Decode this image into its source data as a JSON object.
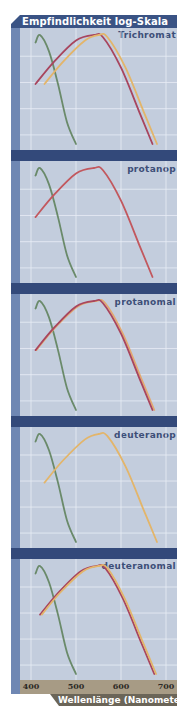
{
  "chart_data": {
    "type": "line",
    "title": "Empfindlichkeit log-Skala",
    "xlabel": "Wellenlänge (Nanometer)",
    "ylabel": "Empfindlichkeit log-Skala",
    "x_ticks": [
      "400",
      "500",
      "600",
      "700"
    ],
    "xlim": [
      390,
      710
    ],
    "grid": true,
    "legend": "none",
    "colors": {
      "S-cone": "#6a8a6a",
      "M-cone": "#e0b46a",
      "L-cone": "#b04a5a",
      "plot_bg": "#c3cddd",
      "grid": "#e6ecf4",
      "band": "#33497a"
    },
    "panels": [
      {
        "label": "Trichromat",
        "series": [
          {
            "name": "S-cone (kurzwellig)",
            "color": "#6a8a6a",
            "x": [
              410,
              420,
              440,
              460,
              480,
              500
            ],
            "y_rel": [
              0.93,
              1.0,
              0.85,
              0.55,
              0.2,
              0.0
            ]
          },
          {
            "name": "L-cone (langwellig)",
            "color": "#a8455e",
            "x": [
              410,
              450,
              500,
              540,
              560,
              600,
              640,
              670
            ],
            "y_rel": [
              0.55,
              0.75,
              0.95,
              1.0,
              0.98,
              0.7,
              0.3,
              0.0
            ]
          },
          {
            "name": "M-cone (mittelwellig)",
            "color": "#e3b56a",
            "x": [
              430,
              470,
              520,
              550,
              570,
              610,
              650,
              680
            ],
            "y_rel": [
              0.55,
              0.75,
              0.95,
              1.0,
              0.98,
              0.7,
              0.3,
              0.0
            ]
          }
        ]
      },
      {
        "label": "protanop",
        "series": [
          {
            "name": "S-cone (kurzwellig)",
            "color": "#6a8a6a",
            "x": [
              410,
              420,
              440,
              460,
              480,
              500
            ],
            "y_rel": [
              0.93,
              1.0,
              0.85,
              0.55,
              0.2,
              0.0
            ]
          },
          {
            "name": "L-cone (langwellig)",
            "color": "#c2585e",
            "x": [
              410,
              450,
              500,
              540,
              560,
              600,
              640,
              670
            ],
            "y_rel": [
              0.55,
              0.75,
              0.95,
              1.0,
              0.98,
              0.7,
              0.3,
              0.0
            ]
          }
        ]
      },
      {
        "label": "protanomal",
        "series": [
          {
            "name": "S-cone (kurzwellig)",
            "color": "#6a8a6a",
            "x": [
              410,
              420,
              440,
              460,
              480,
              500
            ],
            "y_rel": [
              0.93,
              1.0,
              0.85,
              0.55,
              0.2,
              0.0
            ]
          },
          {
            "name": "M-cone (mittelwellig)",
            "color": "#e3a870",
            "x": [
              412,
              452,
              504,
              545,
              565,
              604,
              644,
              674
            ],
            "y_rel": [
              0.55,
              0.75,
              0.95,
              1.0,
              0.98,
              0.7,
              0.3,
              0.0
            ]
          },
          {
            "name": "L-cone anomal",
            "color": "#a8455e",
            "x": [
              410,
              450,
              500,
              540,
              560,
              600,
              640,
              670
            ],
            "y_rel": [
              0.55,
              0.75,
              0.95,
              1.0,
              0.98,
              0.7,
              0.3,
              0.0
            ]
          }
        ]
      },
      {
        "label": "deuteranop",
        "series": [
          {
            "name": "S-cone (kurzwellig)",
            "color": "#6a8a6a",
            "x": [
              410,
              420,
              440,
              460,
              480,
              500
            ],
            "y_rel": [
              0.93,
              1.0,
              0.85,
              0.55,
              0.2,
              0.0
            ]
          },
          {
            "name": "M-cone (mittelwellig)",
            "color": "#e3b56a",
            "x": [
              430,
              470,
              520,
              550,
              570,
              610,
              650,
              680
            ],
            "y_rel": [
              0.55,
              0.75,
              0.95,
              1.0,
              0.98,
              0.7,
              0.3,
              0.0
            ]
          }
        ]
      },
      {
        "label": "deuteranomal",
        "series": [
          {
            "name": "S-cone (kurzwellig)",
            "color": "#6a8a6a",
            "x": [
              410,
              420,
              440,
              460,
              480,
              500
            ],
            "y_rel": [
              0.93,
              1.0,
              0.85,
              0.55,
              0.2,
              0.0
            ]
          },
          {
            "name": "M-cone anomal",
            "color": "#a8455e",
            "x": [
              420,
              460,
              510,
              545,
              565,
              604,
              644,
              674
            ],
            "y_rel": [
              0.55,
              0.75,
              0.95,
              1.0,
              0.98,
              0.7,
              0.3,
              0.0
            ]
          },
          {
            "name": "L-cone (langwellig)",
            "color": "#e3b56a",
            "x": [
              424,
              464,
              515,
              550,
              570,
              608,
              648,
              678
            ],
            "y_rel": [
              0.55,
              0.75,
              0.95,
              1.0,
              0.98,
              0.7,
              0.3,
              0.0
            ]
          }
        ]
      }
    ]
  },
  "header": {
    "title": "Empfindlichkeit log-Skala"
  },
  "panels": [
    {
      "label": "Trichromat"
    },
    {
      "label": "protanop"
    },
    {
      "label": "protanomal"
    },
    {
      "label": "deuteranop"
    },
    {
      "label": "deuteranomal"
    }
  ],
  "xaxis": {
    "ticks": [
      "400",
      "500",
      "600",
      "700"
    ],
    "label": "Wellenlänge (Nanometer)"
  }
}
